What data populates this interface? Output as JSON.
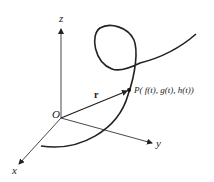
{
  "diagram": {
    "axes": {
      "x_label": "x",
      "y_label": "y",
      "z_label": "z",
      "origin_label": "O"
    },
    "vector_label": "r",
    "point_label": "P( f(t), g(t), h(t))",
    "colors": {
      "stroke": "#222222",
      "background": "#ffffff"
    }
  }
}
